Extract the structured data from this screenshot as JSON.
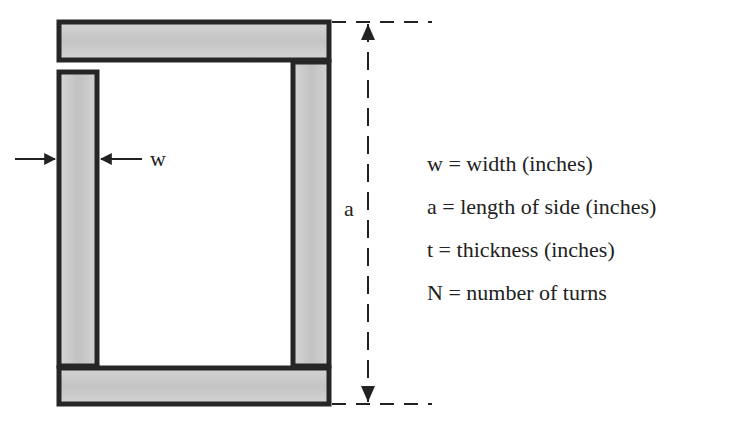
{
  "diagram": {
    "labels": {
      "width_marker": "w",
      "side_marker": "a"
    },
    "legend": [
      "w = width (inches)",
      "a = length of side (inches)",
      "t = thickness (inches)",
      "N = number of turns"
    ],
    "colors": {
      "bar_fill": "#c9c9c9",
      "outline": "#262626",
      "background": "#ffffff"
    }
  }
}
